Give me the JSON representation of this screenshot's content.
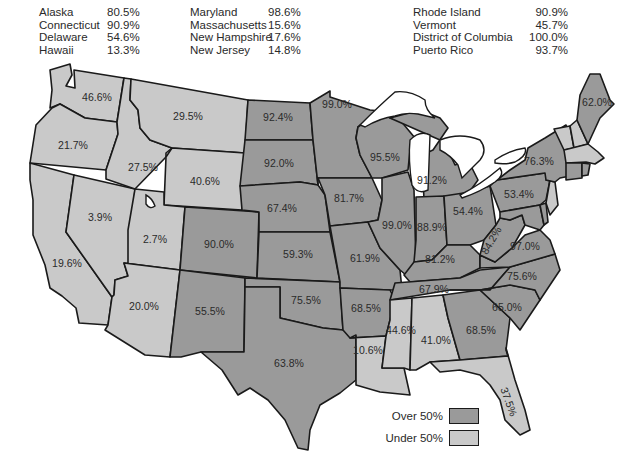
{
  "colors": {
    "over_50": "#9a9a9a",
    "under_50": "#c9c9c9",
    "border": "#1a1a1a",
    "text": "#2a2a2a"
  },
  "extra_regions": {
    "col1": [
      {
        "name": "Alaska",
        "value": "80.5%"
      },
      {
        "name": "Connecticut",
        "value": "90.9%"
      },
      {
        "name": "Delaware",
        "value": "54.6%"
      },
      {
        "name": "Hawaii",
        "value": "13.3%"
      }
    ],
    "col2": [
      {
        "name": "Maryland",
        "value": "98.6%"
      },
      {
        "name": "Massachusetts",
        "value": "15.6%"
      },
      {
        "name": "New Hampshire",
        "value": "17.6%"
      },
      {
        "name": "New Jersey",
        "value": "14.8%"
      }
    ],
    "col3": [
      {
        "name": "Rhode Island",
        "value": "90.9%"
      },
      {
        "name": "Vermont",
        "value": "45.7%"
      },
      {
        "name": "District of Columbia",
        "value": "100.0%"
      },
      {
        "name": "Puerto Rico",
        "value": "93.7%"
      }
    ]
  },
  "states": {
    "WA": {
      "label": "46.6%",
      "over": false
    },
    "OR": {
      "label": "21.7%",
      "over": false
    },
    "CA": {
      "label": "19.6%",
      "over": false
    },
    "NV": {
      "label": "3.9%",
      "over": false
    },
    "ID": {
      "label": "27.5%",
      "over": false
    },
    "MT": {
      "label": "29.5%",
      "over": false
    },
    "WY": {
      "label": "40.6%",
      "over": false
    },
    "UT": {
      "label": "2.7%",
      "over": false
    },
    "AZ": {
      "label": "20.0%",
      "over": false
    },
    "CO": {
      "label": "90.0%",
      "over": true
    },
    "NM": {
      "label": "55.5%",
      "over": true
    },
    "ND": {
      "label": "92.4%",
      "over": true
    },
    "SD": {
      "label": "92.0%",
      "over": true
    },
    "NE": {
      "label": "67.4%",
      "over": true
    },
    "KS": {
      "label": "59.3%",
      "over": true
    },
    "OK": {
      "label": "75.5%",
      "over": true
    },
    "TX": {
      "label": "63.8%",
      "over": true
    },
    "MN": {
      "label": "99.0%",
      "over": true
    },
    "IA": {
      "label": "81.7%",
      "over": true
    },
    "MO": {
      "label": "61.9%",
      "over": true
    },
    "AR": {
      "label": "68.5%",
      "over": true
    },
    "LA": {
      "label": "10.6%",
      "over": false
    },
    "WI": {
      "label": "95.5%",
      "over": true
    },
    "IL": {
      "label": "99.0%",
      "over": true
    },
    "MI": {
      "label": "91.2%",
      "over": true
    },
    "IN": {
      "label": "88.9%",
      "over": true
    },
    "OH": {
      "label": "54.4%",
      "over": true
    },
    "KY": {
      "label": "81.2%",
      "over": true
    },
    "TN": {
      "label": "67.9%",
      "over": true
    },
    "MS": {
      "label": "44.6%",
      "over": false
    },
    "AL": {
      "label": "41.0%",
      "over": false
    },
    "GA": {
      "label": "68.5%",
      "over": true
    },
    "FL": {
      "label": "37.5%",
      "over": false
    },
    "SC": {
      "label": "65.0%",
      "over": true
    },
    "NC": {
      "label": "75.6%",
      "over": true
    },
    "VA": {
      "label": "97.0%",
      "over": true
    },
    "WV": {
      "label": "84.2%",
      "over": true
    },
    "PA": {
      "label": "53.4%",
      "over": true
    },
    "NY": {
      "label": "76.3%",
      "over": true
    },
    "ME": {
      "label": "62.0%",
      "over": true
    },
    "VT": {
      "label": "",
      "over": false
    },
    "NH": {
      "label": "",
      "over": false
    },
    "MA": {
      "label": "",
      "over": false
    },
    "CT": {
      "label": "",
      "over": true
    },
    "RI": {
      "label": "",
      "over": true
    },
    "NJ": {
      "label": "",
      "over": false
    },
    "DE": {
      "label": "",
      "over": true
    },
    "MD": {
      "label": "",
      "over": true
    }
  },
  "legend": {
    "over_label": "Over 50%",
    "under_label": "Under 50%"
  }
}
